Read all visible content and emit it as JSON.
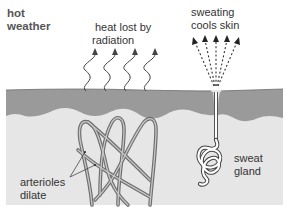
{
  "title": "hot weather",
  "title_lines": [
    "hot",
    "weather"
  ],
  "labels": {
    "radiation": [
      "heat lost by",
      "radiation"
    ],
    "sweating": [
      "sweating",
      "cools skin"
    ],
    "arterioles": [
      "arterioles",
      "dilate"
    ],
    "sweat_gland": [
      "sweat",
      "gland"
    ]
  },
  "colors": {
    "background": "#ffffff",
    "epidermis": "#9a9a9a",
    "dermis": "#e6e6e6",
    "vessel": "#8c8c8c",
    "text": "#333333",
    "gland_fill": "#ffffff"
  }
}
